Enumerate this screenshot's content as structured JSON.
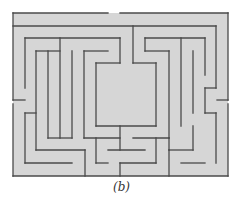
{
  "figure": {
    "caption": "(b)",
    "type": "maze",
    "colors": {
      "background": "#ffffff",
      "maze_fill": "#d6d6d6",
      "wall": "#4a4a4a"
    }
  },
  "maze": {
    "bounds": {
      "x": 13,
      "y": 13,
      "w": 215,
      "h": 163
    },
    "walls": [
      [
        13,
        13,
        108,
        13
      ],
      [
        120,
        13,
        228,
        13
      ],
      [
        13,
        13,
        13,
        100
      ],
      [
        13,
        104,
        13,
        176
      ],
      [
        228,
        13,
        228,
        100
      ],
      [
        228,
        104,
        228,
        176
      ],
      [
        13,
        176,
        228,
        176
      ],
      [
        13,
        26,
        216,
        26
      ],
      [
        216,
        26,
        216,
        88
      ],
      [
        216,
        88,
        205,
        88
      ],
      [
        205,
        88,
        205,
        113
      ],
      [
        205,
        113,
        216,
        113
      ],
      [
        216,
        113,
        216,
        163
      ],
      [
        217,
        100,
        228,
        100
      ],
      [
        13,
        100,
        25,
        100
      ],
      [
        25,
        38,
        25,
        88
      ],
      [
        25,
        38,
        120,
        38
      ],
      [
        120,
        38,
        120,
        63
      ],
      [
        120,
        63,
        96,
        63
      ],
      [
        96,
        63,
        96,
        126
      ],
      [
        96,
        126,
        156,
        126
      ],
      [
        156,
        126,
        156,
        63
      ],
      [
        156,
        63,
        133,
        63
      ],
      [
        133,
        63,
        133,
        26
      ],
      [
        60,
        38,
        60,
        138
      ],
      [
        36,
        51,
        60,
        51
      ],
      [
        36,
        51,
        36,
        150
      ],
      [
        36,
        150,
        85,
        150
      ],
      [
        85,
        150,
        85,
        176
      ],
      [
        48,
        51,
        48,
        138
      ],
      [
        48,
        138,
        72,
        138
      ],
      [
        72,
        51,
        72,
        138
      ],
      [
        84,
        51,
        108,
        51
      ],
      [
        84,
        51,
        84,
        138
      ],
      [
        84,
        138,
        120,
        138
      ],
      [
        25,
        113,
        36,
        113
      ],
      [
        25,
        113,
        25,
        163
      ],
      [
        25,
        163,
        72,
        163
      ],
      [
        120,
        126,
        120,
        150
      ],
      [
        108,
        150,
        145,
        150
      ],
      [
        96,
        138,
        96,
        163
      ],
      [
        96,
        163,
        108,
        163
      ],
      [
        120,
        163,
        156,
        163
      ],
      [
        120,
        163,
        120,
        176
      ],
      [
        156,
        138,
        156,
        163
      ],
      [
        133,
        138,
        169,
        138
      ],
      [
        169,
        138,
        169,
        150
      ],
      [
        169,
        150,
        193,
        150
      ],
      [
        193,
        150,
        193,
        126
      ],
      [
        169,
        150,
        169,
        176
      ],
      [
        145,
        38,
        205,
        38
      ],
      [
        205,
        38,
        205,
        75
      ],
      [
        145,
        38,
        145,
        51
      ],
      [
        145,
        51,
        169,
        51
      ],
      [
        169,
        51,
        169,
        138
      ],
      [
        181,
        38,
        181,
        126
      ],
      [
        193,
        51,
        193,
        113
      ],
      [
        181,
        163,
        205,
        163
      ]
    ]
  }
}
